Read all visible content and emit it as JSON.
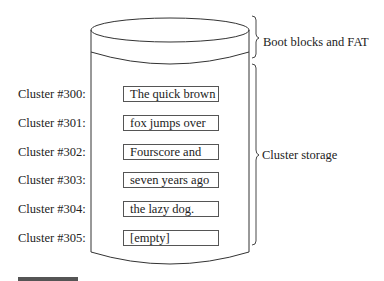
{
  "diagram": {
    "type": "disk-cylinder",
    "regions": {
      "top": "Boot blocks and FAT",
      "main": "Cluster storage"
    },
    "clusters": [
      {
        "label": "Cluster #300:",
        "content": "The quick brown"
      },
      {
        "label": "Cluster #301:",
        "content": "fox jumps over"
      },
      {
        "label": "Cluster #302:",
        "content": "Fourscore and"
      },
      {
        "label": "Cluster #303:",
        "content": "seven years ago"
      },
      {
        "label": "Cluster #304:",
        "content": "the lazy dog."
      },
      {
        "label": "Cluster #305:",
        "content": "[empty]"
      }
    ],
    "colors": {
      "stroke": "#333333",
      "text": "#222222",
      "footer_bar": "#555555"
    }
  }
}
